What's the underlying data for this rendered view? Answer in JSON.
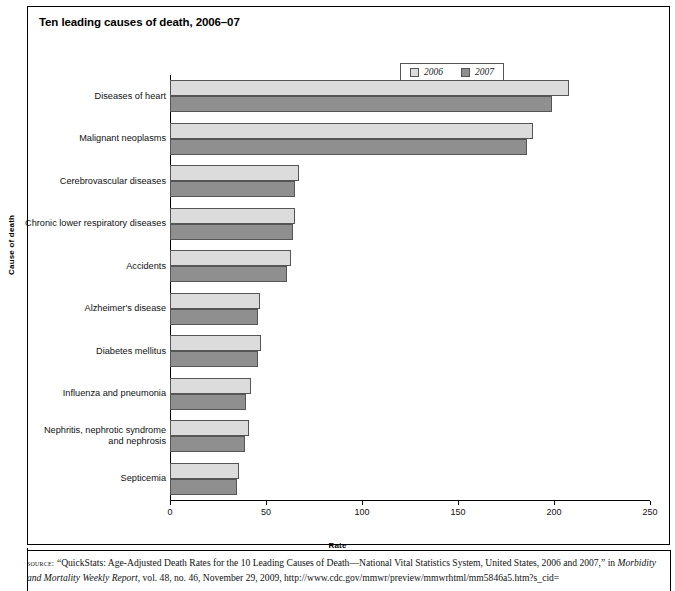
{
  "figure": {
    "title": "Ten leading causes of death, 2006–07",
    "y_axis_title": "Cause of death",
    "x_axis_title": "Rate"
  },
  "legend": {
    "position": "top-right",
    "items": [
      {
        "label": "2006",
        "color": "#dcdcdc"
      },
      {
        "label": "2007",
        "color": "#8f8f8f"
      }
    ]
  },
  "source": {
    "label": "source:",
    "line1": "“QuickStats: Age-Adjusted Death Rates for the 10 Leading Causes of Death—National Vital Statistics System, United States, 2006 and 2007,”",
    "line2_prefix": "in ",
    "line2_italic": "Morbidity and Mortality Weekly Report",
    "line2_suffix": ", vol. 48, no. 46, November 29, 2009, http://www.cdc.gov/mmwr/preview/mmwrhtml/mm5846a5.htm?s_cid="
  },
  "chart_data": {
    "type": "bar",
    "orientation": "horizontal",
    "title": "Ten leading causes of death, 2006–07",
    "xlabel": "Rate",
    "ylabel": "Cause of death",
    "xlim": [
      0,
      250
    ],
    "xticks": [
      0,
      50,
      100,
      150,
      200,
      250
    ],
    "grid": false,
    "legend_position": "top-right",
    "categories": [
      "Diseases of heart",
      "Malignant neoplasms",
      "Cerebrovascular diseases",
      "Chronic lower respiratory diseases",
      "Accidents",
      "Alzheimer's disease",
      "Diabetes mellitus",
      "Influenza and pneumonia",
      "Nephritis, nephrotic syndrome and nephrosis",
      "Septicemia"
    ],
    "category_lines": [
      [
        "Diseases of heart"
      ],
      [
        "Malignant neoplasms"
      ],
      [
        "Cerebrovascular diseases"
      ],
      [
        "Chronic lower respiratory diseases"
      ],
      [
        "Accidents"
      ],
      [
        "Alzheimer's disease"
      ],
      [
        "Diabetes mellitus"
      ],
      [
        "Influenza and pneumonia"
      ],
      [
        "Nephritis, nephrotic syndrome",
        "and nephrosis"
      ],
      [
        "Septicemia"
      ]
    ],
    "series": [
      {
        "name": "2006",
        "color": "#dcdcdc",
        "values": [
          208.0,
          189.0,
          67.0,
          65.0,
          63.0,
          47.0,
          47.5,
          42.0,
          41.0,
          36.0
        ]
      },
      {
        "name": "2007",
        "color": "#8f8f8f",
        "values": [
          199.0,
          186.0,
          65.0,
          64.0,
          61.0,
          46.0,
          46.0,
          39.5,
          39.0,
          35.0
        ]
      }
    ]
  }
}
